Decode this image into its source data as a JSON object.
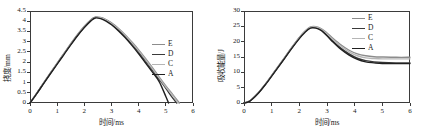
{
  "figure": {
    "panels": [
      {
        "id": "deflection-panel",
        "axes": {
          "xlabel": "时间/ms",
          "ylabel": "挠度/mm",
          "xlim": [
            0,
            6
          ],
          "ylim": [
            0,
            4.5
          ],
          "xticks": [
            "0",
            "1",
            "2",
            "3",
            "4",
            "5",
            "6"
          ],
          "xtick_values": [
            0,
            1,
            2,
            3,
            4,
            5,
            6
          ],
          "yticks": [
            "0",
            "0.5",
            "1",
            "1.5",
            "2",
            "2.5",
            "3",
            "3.5",
            "4",
            "4.5"
          ],
          "ytick_values": [
            0,
            0.5,
            1,
            1.5,
            2,
            2.5,
            3,
            3.5,
            4,
            4.5
          ],
          "grid": false
        },
        "legend": {
          "position": "center-right",
          "entries": [
            {
              "label": "E",
              "color": "#8c8c8c"
            },
            {
              "label": "D",
              "color": "#3a3a3a"
            },
            {
              "label": "C",
              "color": "#b5b5b5"
            },
            {
              "label": "A",
              "color": "#1f1f1f"
            }
          ]
        }
      },
      {
        "id": "energy-panel",
        "axes": {
          "xlabel": "时间/ms",
          "ylabel": "吸收能量/J",
          "xlim": [
            0,
            6
          ],
          "ylim": [
            0,
            30
          ],
          "xticks": [
            "0",
            "1",
            "2",
            "3",
            "4",
            "5",
            "6"
          ],
          "xtick_values": [
            0,
            1,
            2,
            3,
            4,
            5,
            6
          ],
          "yticks": [
            "0",
            "5",
            "10",
            "15",
            "20",
            "25",
            "30"
          ],
          "ytick_values": [
            0,
            5,
            10,
            15,
            20,
            25,
            30
          ],
          "grid": false
        },
        "legend": {
          "position": "top-right",
          "entries": [
            {
              "label": "E",
              "color": "#8c8c8c"
            },
            {
              "label": "D",
              "color": "#3a3a3a"
            },
            {
              "label": "C",
              "color": "#b5b5b5"
            },
            {
              "label": "A",
              "color": "#1f1f1f"
            }
          ]
        }
      }
    ]
  },
  "chart_data": [
    {
      "type": "line",
      "title": "",
      "xlabel": "时间/ms",
      "ylabel": "挠度/mm",
      "xlim": [
        0,
        6
      ],
      "ylim": [
        0,
        4.5
      ],
      "grid": false,
      "legend_position": "center-right",
      "series": [
        {
          "name": "E",
          "color": "#8c8c8c",
          "x": [
            0,
            0.25,
            0.5,
            0.75,
            1.0,
            1.25,
            1.5,
            1.75,
            2.0,
            2.25,
            2.4,
            2.6,
            2.8,
            3.0,
            3.25,
            3.5,
            3.75,
            4.0,
            4.25,
            4.5,
            4.75,
            5.0,
            5.25,
            5.5
          ],
          "y": [
            0,
            0.48,
            0.98,
            1.47,
            1.95,
            2.42,
            2.9,
            3.35,
            3.75,
            4.08,
            4.2,
            4.18,
            4.08,
            3.92,
            3.66,
            3.34,
            2.98,
            2.6,
            2.18,
            1.74,
            1.28,
            0.84,
            0.42,
            0
          ]
        },
        {
          "name": "D",
          "color": "#3a3a3a",
          "x": [
            0,
            0.25,
            0.5,
            0.75,
            1.0,
            1.25,
            1.5,
            1.75,
            2.0,
            2.25,
            2.4,
            2.6,
            2.8,
            3.0,
            3.25,
            3.5,
            3.75,
            4.0,
            4.25,
            4.5,
            4.75,
            5.0,
            5.2,
            5.4
          ],
          "y": [
            0,
            0.47,
            0.96,
            1.45,
            1.93,
            2.4,
            2.87,
            3.32,
            3.72,
            4.06,
            4.18,
            4.16,
            4.05,
            3.88,
            3.6,
            3.27,
            2.9,
            2.5,
            2.07,
            1.62,
            1.17,
            0.72,
            0.34,
            0
          ]
        },
        {
          "name": "C",
          "color": "#b5b5b5",
          "x": [
            0,
            0.25,
            0.5,
            0.75,
            1.0,
            1.25,
            1.5,
            1.75,
            2.0,
            2.25,
            2.4,
            2.6,
            2.8,
            3.0,
            3.25,
            3.5,
            3.75,
            4.0,
            4.25,
            4.5,
            4.75,
            5.0,
            5.25,
            5.45
          ],
          "y": [
            0,
            0.48,
            0.97,
            1.46,
            1.94,
            2.41,
            2.88,
            3.33,
            3.74,
            4.07,
            4.19,
            4.17,
            4.07,
            3.9,
            3.63,
            3.31,
            2.94,
            2.55,
            2.13,
            1.68,
            1.23,
            0.78,
            0.37,
            0
          ]
        },
        {
          "name": "A",
          "color": "#1f1f1f",
          "x": [
            0,
            0.25,
            0.5,
            0.75,
            1.0,
            1.25,
            1.5,
            1.75,
            2.0,
            2.25,
            2.4,
            2.6,
            2.8,
            3.0,
            3.25,
            3.5,
            3.75,
            4.0,
            4.25,
            4.5,
            4.75,
            5.0,
            5.1
          ],
          "y": [
            0,
            0.46,
            0.95,
            1.43,
            1.9,
            2.37,
            2.84,
            3.29,
            3.69,
            4.03,
            4.16,
            4.13,
            4.01,
            3.83,
            3.54,
            3.2,
            2.82,
            2.41,
            1.97,
            1.52,
            1.06,
            0.32,
            0
          ]
        }
      ],
      "annotations": {
        "peak_value": 4.2,
        "peak_time": 2.4
      }
    },
    {
      "type": "line",
      "title": "",
      "xlabel": "时间/ms",
      "ylabel": "吸收能量/J",
      "xlim": [
        0,
        6
      ],
      "ylim": [
        0,
        30
      ],
      "grid": false,
      "legend_position": "top-right",
      "series": [
        {
          "name": "E",
          "color": "#8c8c8c",
          "x": [
            0,
            0.2,
            0.5,
            0.8,
            1.1,
            1.4,
            1.7,
            2.0,
            2.2,
            2.4,
            2.6,
            2.8,
            3.0,
            3.2,
            3.5,
            3.8,
            4.1,
            4.4,
            4.7,
            5.0,
            5.5,
            6.0
          ],
          "y": [
            0,
            0.6,
            3.2,
            6.5,
            10.2,
            14.0,
            17.8,
            21.4,
            23.4,
            24.8,
            24.9,
            24.2,
            22.8,
            21.2,
            19.0,
            17.2,
            16.0,
            15.4,
            15.1,
            15.0,
            14.9,
            14.9
          ]
        },
        {
          "name": "D",
          "color": "#3a3a3a",
          "x": [
            0,
            0.2,
            0.5,
            0.8,
            1.1,
            1.4,
            1.7,
            2.0,
            2.2,
            2.4,
            2.6,
            2.8,
            3.0,
            3.2,
            3.5,
            3.8,
            4.1,
            4.4,
            4.7,
            5.0,
            5.5,
            6.0
          ],
          "y": [
            0,
            0.6,
            3.1,
            6.4,
            10.1,
            13.8,
            17.6,
            21.2,
            23.2,
            24.6,
            24.6,
            23.8,
            22.2,
            20.4,
            17.9,
            16.0,
            14.6,
            13.8,
            13.4,
            13.2,
            13.1,
            13.1
          ]
        },
        {
          "name": "C",
          "color": "#b5b5b5",
          "x": [
            0,
            0.2,
            0.5,
            0.8,
            1.1,
            1.4,
            1.7,
            2.0,
            2.2,
            2.4,
            2.6,
            2.8,
            3.0,
            3.2,
            3.5,
            3.8,
            4.1,
            4.4,
            4.7,
            5.0,
            5.5,
            6.0
          ],
          "y": [
            0,
            0.6,
            3.15,
            6.45,
            10.15,
            13.9,
            17.7,
            21.3,
            23.3,
            24.7,
            24.8,
            24.0,
            22.5,
            20.8,
            18.5,
            16.7,
            15.4,
            14.7,
            14.5,
            14.4,
            14.4,
            14.4
          ]
        },
        {
          "name": "A",
          "color": "#1f1f1f",
          "x": [
            0,
            0.2,
            0.5,
            0.8,
            1.1,
            1.4,
            1.7,
            2.0,
            2.2,
            2.4,
            2.6,
            2.8,
            3.0,
            3.2,
            3.5,
            3.8,
            4.1,
            4.4,
            4.7,
            5.0,
            5.5,
            6.0
          ],
          "y": [
            0,
            0.55,
            3.0,
            6.3,
            10.0,
            13.7,
            17.5,
            21.0,
            23.0,
            24.4,
            24.4,
            23.6,
            21.9,
            20.0,
            17.5,
            15.6,
            14.2,
            13.4,
            13.1,
            12.9,
            12.85,
            12.85
          ]
        }
      ],
      "annotations": {
        "peak_value": 25,
        "peak_time": 2.5
      }
    }
  ]
}
